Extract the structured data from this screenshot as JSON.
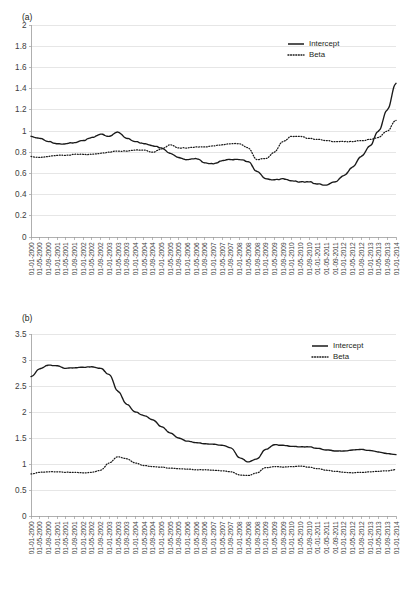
{
  "figure": {
    "panel_a_label": "(a)",
    "panel_b_label": "(b)"
  },
  "chart_data": [
    {
      "id": "panel-a",
      "type": "line",
      "title": "(a)",
      "xlabel": "",
      "ylabel": "",
      "ylim": [
        0,
        2
      ],
      "yticks": [
        0,
        0.2,
        0.4,
        0.6,
        0.8,
        1,
        1.2,
        1.4,
        1.6,
        1.8,
        2
      ],
      "ytick_labels": [
        "0",
        "0.2",
        "0.4",
        "0.6",
        "0.8",
        "1",
        "1.2",
        "1.4",
        "1.6",
        "1.8",
        "2"
      ],
      "grid": true,
      "legend_position": "top-right",
      "categories": [
        "01-01-2000",
        "01-05-2000",
        "01-09-2000",
        "01-01-2001",
        "01-05-2001",
        "01-09-2001",
        "01-01-2002",
        "01-05-2002",
        "01-09-2002",
        "01-01-2003",
        "01-05-2003",
        "01-09-2003",
        "01-01-2004",
        "01-05-2004",
        "01-09-2004",
        "01-01-2005",
        "01-05-2005",
        "01-09-2005",
        "01-01-2006",
        "01-05-2006",
        "01-09-2006",
        "01-01-2007",
        "01-05-2007",
        "01-09-2007",
        "01-01-2008",
        "01-05-2008",
        "01-09-2008",
        "01-01-2009",
        "01-05-2009",
        "01-09-2009",
        "01-01-2010",
        "01-05-2010",
        "01-09-2010",
        "01-01-2011",
        "01-05-2011",
        "01-09-2011",
        "01-01-2012",
        "01-05-2012",
        "01-09-2012",
        "01-01-2013",
        "01-05-2013",
        "01-09-2013",
        "01-01-2014"
      ],
      "series": [
        {
          "name": "Intercept",
          "style": "solid",
          "values": [
            0.95,
            0.93,
            0.9,
            0.88,
            0.88,
            0.89,
            0.91,
            0.94,
            0.97,
            0.95,
            0.99,
            0.93,
            0.9,
            0.88,
            0.86,
            0.84,
            0.79,
            0.75,
            0.73,
            0.74,
            0.7,
            0.69,
            0.72,
            0.73,
            0.73,
            0.71,
            0.62,
            0.55,
            0.54,
            0.55,
            0.53,
            0.52,
            0.52,
            0.5,
            0.49,
            0.52,
            0.58,
            0.66,
            0.76,
            0.86,
            1.0,
            1.2,
            1.45
          ]
        },
        {
          "name": "Beta",
          "style": "dotted",
          "values": [
            0.76,
            0.75,
            0.76,
            0.77,
            0.77,
            0.78,
            0.78,
            0.78,
            0.79,
            0.8,
            0.81,
            0.81,
            0.82,
            0.82,
            0.8,
            0.83,
            0.87,
            0.84,
            0.84,
            0.85,
            0.85,
            0.86,
            0.87,
            0.88,
            0.88,
            0.84,
            0.73,
            0.74,
            0.8,
            0.9,
            0.95,
            0.95,
            0.93,
            0.92,
            0.91,
            0.9,
            0.9,
            0.9,
            0.91,
            0.92,
            0.94,
            1.0,
            1.1
          ]
        }
      ],
      "series_detail_note": "43 tick labels at 4-month intervals; the plotted series are monthly so curves are denser than the tick grid."
    },
    {
      "id": "panel-b",
      "type": "line",
      "title": "(b)",
      "xlabel": "",
      "ylabel": "",
      "ylim": [
        0,
        3.5
      ],
      "yticks": [
        0,
        0.5,
        1,
        1.5,
        2,
        2.5,
        3,
        3.5
      ],
      "ytick_labels": [
        "0",
        "0.5",
        "1",
        "1.5",
        "2",
        "2.5",
        "3",
        "3.5"
      ],
      "grid": true,
      "legend_position": "top-right",
      "categories": [
        "01-01-2000",
        "01-05-2000",
        "01-09-2000",
        "01-01-2001",
        "01-05-2001",
        "01-09-2001",
        "01-01-2002",
        "01-05-2002",
        "01-09-2002",
        "01-01-2003",
        "01-05-2003",
        "01-09-2003",
        "01-01-2004",
        "01-05-2004",
        "01-09-2004",
        "01-01-2005",
        "01-05-2005",
        "01-09-2005",
        "01-01-2006",
        "01-05-2006",
        "01-09-2006",
        "01-01-2007",
        "01-05-2007",
        "01-09-2007",
        "01-01-2008",
        "01-05-2008",
        "01-09-2008",
        "01-01-2009",
        "01-05-2009",
        "01-09-2009",
        "01-01-2010",
        "01-05-2010",
        "01-09-2010",
        "01-01-2011",
        "01-05-2011",
        "01-09-2011",
        "01-01-2012",
        "01-05-2012",
        "01-09-2012",
        "01-01-2013",
        "01-05-2013",
        "01-09-2013",
        "01-01-2014"
      ],
      "series": [
        {
          "name": "Intercept",
          "style": "solid",
          "values": [
            2.68,
            2.83,
            2.9,
            2.89,
            2.84,
            2.85,
            2.86,
            2.87,
            2.84,
            2.72,
            2.4,
            2.15,
            2.0,
            1.93,
            1.85,
            1.72,
            1.6,
            1.5,
            1.44,
            1.41,
            1.39,
            1.38,
            1.36,
            1.31,
            1.12,
            1.04,
            1.1,
            1.28,
            1.37,
            1.36,
            1.34,
            1.33,
            1.33,
            1.3,
            1.27,
            1.25,
            1.25,
            1.27,
            1.28,
            1.26,
            1.23,
            1.2,
            1.18
          ]
        },
        {
          "name": "Beta",
          "style": "dotted",
          "values": [
            0.81,
            0.84,
            0.85,
            0.85,
            0.84,
            0.84,
            0.83,
            0.84,
            0.88,
            1.02,
            1.14,
            1.1,
            1.02,
            0.97,
            0.95,
            0.94,
            0.92,
            0.91,
            0.9,
            0.89,
            0.89,
            0.88,
            0.87,
            0.85,
            0.79,
            0.78,
            0.83,
            0.93,
            0.95,
            0.94,
            0.95,
            0.96,
            0.94,
            0.91,
            0.88,
            0.86,
            0.84,
            0.83,
            0.84,
            0.85,
            0.86,
            0.87,
            0.89
          ]
        }
      ]
    }
  ],
  "legend": {
    "intercept_label": "Intercept",
    "beta_label": "Beta"
  }
}
